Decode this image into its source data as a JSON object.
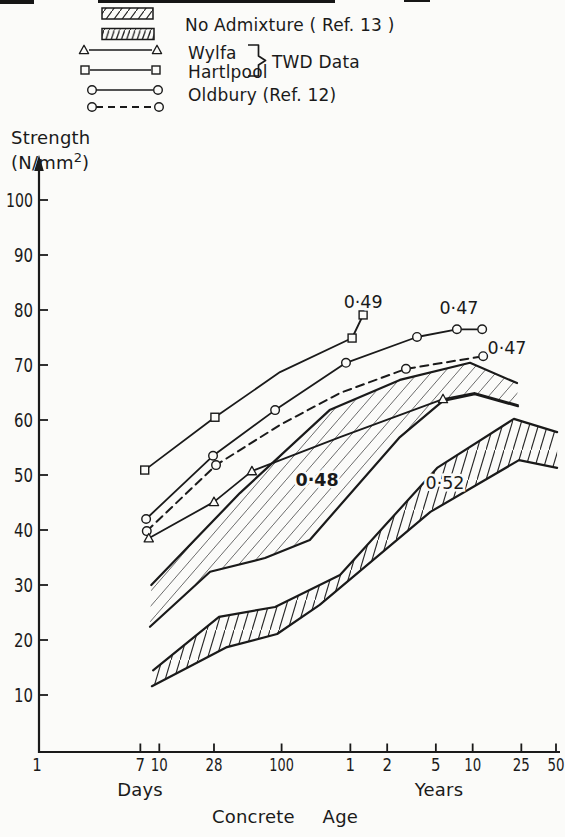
{
  "colors": {
    "ink": "#1a1a1a",
    "paper": "#fbfbf9",
    "hatch_light": "#5a5a5a",
    "hatch_dark": "#262626"
  },
  "legend": {
    "no_admixture": "No Admixture ( Ref. 13 )",
    "wylfa": "Wylfa",
    "hartlepool": "Hartlpool",
    "twd": "TWD Data",
    "oldbury": "Oldbury (Ref. 12)"
  },
  "axes": {
    "y_title": "Strength",
    "y_unit_prefix": "(N/mm",
    "y_unit_sup": "2",
    "y_unit_suffix": ")",
    "y_ticks": [
      100,
      90,
      80,
      70,
      60,
      50,
      40,
      30,
      20,
      10
    ],
    "x_tick_labels": [
      "1",
      "7",
      "10",
      "28",
      "100",
      "1",
      "2",
      "5",
      "10",
      "25",
      "50"
    ],
    "x_tick_ages_days": [
      1,
      7,
      10,
      28,
      100,
      365,
      730,
      1825,
      3650,
      9125,
      18250
    ],
    "days_label": "Days",
    "years_label": "Years",
    "x_title": "Concrete Age"
  },
  "chart_data": {
    "type": "line",
    "x_scale": "log",
    "x_unit": "days",
    "xlabel": "Concrete Age",
    "ylabel": "Strength (N/mm2)",
    "ylim": [
      0,
      105
    ],
    "series": [
      {
        "name": "Hartlepool (TWD Data)",
        "marker": "square",
        "line": "solid",
        "wc_label": "0·49",
        "points": [
          [
            7.6,
            50.9
          ],
          [
            28.5,
            60.5
          ],
          [
            97,
            68.7
          ],
          [
            377,
            74.9
          ],
          [
            464,
            79.1
          ]
        ],
        "markers": [
          1,
          1,
          0,
          1,
          1
        ]
      },
      {
        "name": "Oldbury (Ref. 12) solid",
        "marker": "circle",
        "line": "solid",
        "wc_label": "0·47",
        "points": [
          [
            7.8,
            42.0
          ],
          [
            27.5,
            53.5
          ],
          [
            88.5,
            61.8
          ],
          [
            336,
            70.4
          ],
          [
            1280,
            75.1
          ],
          [
            2713,
            76.5
          ],
          [
            4364,
            76.5
          ]
        ],
        "markers": [
          1,
          1,
          1,
          1,
          1,
          1,
          1
        ]
      },
      {
        "name": "Oldbury (Ref. 12) dashed",
        "marker": "circle",
        "line": "dashed",
        "wc_label": "0·47",
        "points": [
          [
            7.9,
            39.8
          ],
          [
            29.1,
            51.8
          ],
          [
            97,
            59.1
          ],
          [
            300,
            64.9
          ],
          [
            1040,
            69.3
          ],
          [
            4447,
            71.6
          ]
        ],
        "markers": [
          1,
          1,
          0,
          0,
          1,
          1
        ]
      },
      {
        "name": "Wylfa (TWD Data)",
        "marker": "triangle",
        "line": "solid",
        "points": [
          [
            8.2,
            38.5
          ],
          [
            28,
            45.1
          ],
          [
            57.2,
            50.7
          ],
          [
            300,
            56.9
          ],
          [
            2088,
            63.8
          ],
          [
            3810,
            64.9
          ],
          [
            8574,
            62.7
          ]
        ],
        "markers": [
          1,
          1,
          1,
          0,
          1,
          0,
          0
        ]
      }
    ],
    "bands": [
      {
        "name": "No Admixture (Ref. 13) upper band",
        "wc_label": "0·48",
        "hatch": "light",
        "top": [
          [
            8.6,
            30.0
          ],
          [
            45.6,
            46.7
          ],
          [
            247,
            61.8
          ],
          [
            928,
            67.3
          ],
          [
            3474,
            70.4
          ],
          [
            8413,
            66.7
          ]
        ],
        "bottom": [
          [
            8.4,
            22.4
          ],
          [
            26,
            32.4
          ],
          [
            73.2,
            34.9
          ],
          [
            170,
            38.2
          ],
          [
            928,
            56.9
          ],
          [
            2088,
            63.5
          ],
          [
            3810,
            64.7
          ],
          [
            8574,
            62.5
          ]
        ]
      },
      {
        "name": "No Admixture (Ref. 13) lower band",
        "wc_label": "0·52",
        "hatch": "steep",
        "top": [
          [
            8.9,
            14.5
          ],
          [
            30.8,
            24.2
          ],
          [
            88.5,
            26.0
          ],
          [
            300,
            31.8
          ],
          [
            1870,
            51.3
          ],
          [
            7939,
            60.2
          ],
          [
            17900,
            57.8
          ]
        ],
        "bottom": [
          [
            8.7,
            11.6
          ],
          [
            35.8,
            18.7
          ],
          [
            91.9,
            21.1
          ],
          [
            205,
            26.4
          ],
          [
            1648,
            43.3
          ],
          [
            8736,
            52.7
          ],
          [
            17900,
            51.3
          ]
        ]
      }
    ],
    "annotations": [
      {
        "text": "0·49",
        "age_days": 464,
        "strength": 81.5,
        "bold": false
      },
      {
        "text": "0·47",
        "age_days": 2820,
        "strength": 80.4,
        "bold": false
      },
      {
        "text": "0·47",
        "age_days": 6966,
        "strength": 73.1,
        "bold": false
      },
      {
        "text": "0·48",
        "age_days": 195,
        "strength": 49.1,
        "bold": true
      },
      {
        "text": "0·52",
        "age_days": 2168,
        "strength": 48.5,
        "bold": false
      }
    ]
  }
}
